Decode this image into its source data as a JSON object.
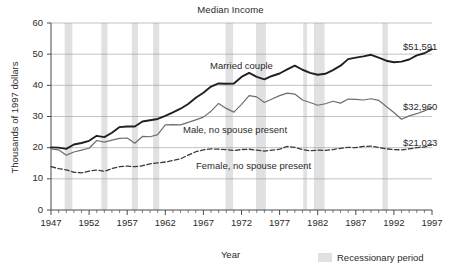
{
  "chart_data": {
    "type": "line",
    "title": "Median Income",
    "xlabel": "Year",
    "ylabel": "Thousands of 1997 dollars",
    "xlim": [
      1947,
      1997
    ],
    "ylim": [
      0,
      60
    ],
    "ytick_labels": [
      "0",
      "10",
      "20",
      "30",
      "40",
      "50",
      "60"
    ],
    "ytick_values": [
      0,
      10,
      20,
      30,
      40,
      50,
      60
    ],
    "xtick_labels": [
      "1947",
      "1952",
      "1957",
      "1962",
      "1967",
      "1972",
      "1977",
      "1982",
      "1987",
      "1992",
      "1997"
    ],
    "xtick_values": [
      1947,
      1952,
      1957,
      1962,
      1967,
      1972,
      1977,
      1982,
      1987,
      1992,
      1997
    ],
    "minor_xticks": "every 1 year",
    "grid": "horizontal",
    "legend_position": "bottom-right",
    "x": [
      1947,
      1948,
      1949,
      1950,
      1951,
      1952,
      1953,
      1954,
      1955,
      1956,
      1957,
      1958,
      1959,
      1960,
      1961,
      1962,
      1963,
      1964,
      1965,
      1966,
      1967,
      1968,
      1969,
      1970,
      1971,
      1972,
      1973,
      1974,
      1975,
      1976,
      1977,
      1978,
      1979,
      1980,
      1981,
      1982,
      1983,
      1984,
      1985,
      1986,
      1987,
      1988,
      1989,
      1990,
      1991,
      1992,
      1993,
      1994,
      1995,
      1996,
      1997
    ],
    "series": [
      {
        "name": "Married couple",
        "label": "Married couple",
        "end_label": "$51,591",
        "end_value": 51.591,
        "style": "solid",
        "color": "#231f20",
        "width": 1.9,
        "values": [
          20.1,
          20.0,
          19.6,
          21.0,
          21.5,
          22.2,
          23.8,
          23.4,
          24.8,
          26.6,
          26.8,
          26.8,
          28.4,
          28.8,
          29.2,
          30.2,
          31.3,
          32.5,
          34.0,
          36.0,
          37.6,
          39.6,
          40.6,
          40.5,
          40.6,
          42.7,
          44.0,
          42.7,
          41.9,
          43.0,
          43.8,
          45.1,
          46.3,
          45.0,
          44.0,
          43.4,
          43.7,
          44.9,
          46.3,
          48.4,
          48.9,
          49.3,
          49.8,
          48.9,
          47.9,
          47.4,
          47.6,
          48.3,
          49.6,
          50.3,
          51.591
        ]
      },
      {
        "name": "Male, no spouse present",
        "label": "Male, no spouse present",
        "end_label": "$32,960",
        "end_value": 32.96,
        "style": "solid",
        "color": "#6d6e70",
        "width": 1.2,
        "values": [
          19.6,
          19.3,
          17.6,
          18.6,
          19.2,
          19.8,
          22.3,
          21.8,
          22.4,
          23.0,
          23.1,
          21.4,
          23.6,
          23.5,
          24.2,
          27.3,
          27.4,
          27.3,
          28.1,
          28.9,
          29.8,
          31.7,
          34.2,
          32.6,
          31.4,
          33.9,
          36.7,
          36.3,
          34.5,
          35.6,
          36.7,
          37.5,
          37.2,
          35.3,
          34.5,
          33.6,
          34.1,
          34.9,
          34.3,
          35.6,
          35.5,
          35.3,
          35.7,
          35.2,
          33.2,
          31.3,
          29.1,
          30.2,
          30.9,
          31.8,
          32.96
        ]
      },
      {
        "name": "Female, no spouse present",
        "label": "Female, no spouse present",
        "end_label": "$21,023",
        "end_value": 21.023,
        "style": "dashed",
        "color": "#3c3a3b",
        "width": 1.3,
        "values": [
          13.9,
          13.3,
          12.9,
          12.1,
          11.9,
          12.5,
          12.8,
          12.4,
          13.3,
          13.9,
          14.1,
          13.9,
          14.2,
          14.8,
          15.1,
          15.4,
          15.9,
          16.4,
          17.6,
          18.7,
          19.3,
          19.6,
          19.5,
          19.4,
          19.1,
          19.4,
          19.5,
          19.2,
          18.9,
          19.2,
          19.5,
          20.4,
          20.1,
          19.4,
          19.0,
          19.2,
          19.1,
          19.4,
          19.8,
          20.1,
          20.0,
          20.4,
          20.5,
          20.1,
          19.6,
          19.4,
          19.3,
          19.6,
          20.0,
          20.2,
          21.023
        ]
      }
    ],
    "recession_bands": [
      {
        "start": 1948.8,
        "end": 1949.8
      },
      {
        "start": 1953.6,
        "end": 1954.4
      },
      {
        "start": 1957.6,
        "end": 1958.4
      },
      {
        "start": 1960.4,
        "end": 1961.2
      },
      {
        "start": 1969.9,
        "end": 1970.9
      },
      {
        "start": 1973.9,
        "end": 1975.2
      },
      {
        "start": 1980.1,
        "end": 1980.6
      },
      {
        "start": 1981.5,
        "end": 1982.9
      },
      {
        "start": 1990.5,
        "end": 1991.2
      }
    ],
    "band_color": "#dfe1e2",
    "annotations": []
  },
  "legend": {
    "swatch_name": "recession-swatch",
    "label": "Recessionary period"
  }
}
